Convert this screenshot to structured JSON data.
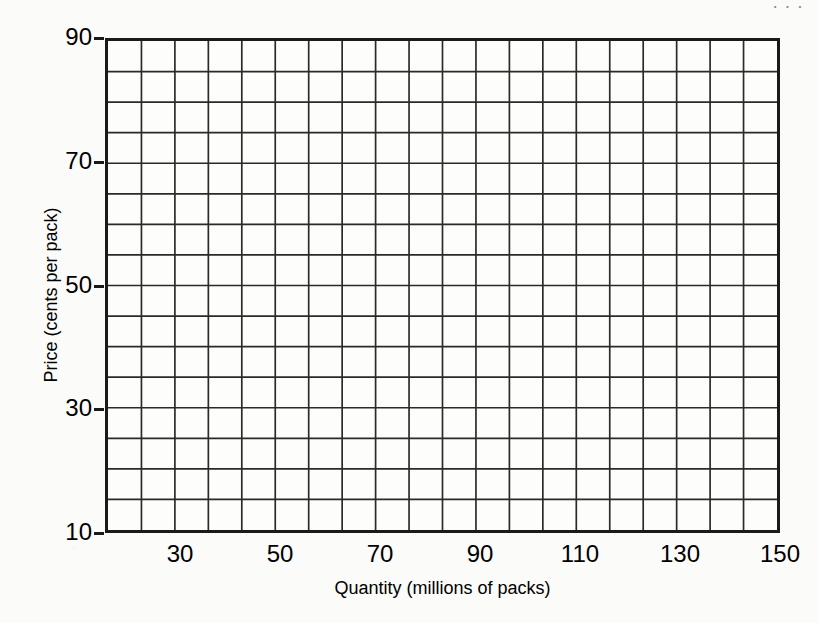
{
  "header_fragment": "···",
  "chart_data": {
    "type": "scatter",
    "title": "",
    "subtitle": "",
    "xlabel": "Quantity (millions of packs)",
    "ylabel": "Price (cents per pack)",
    "xlim": [
      15,
      150
    ],
    "ylim": [
      10,
      90
    ],
    "x_tick_labels": [
      "30",
      "50",
      "70",
      "90",
      "110",
      "130",
      "150"
    ],
    "x_tick_values": [
      30,
      50,
      70,
      90,
      110,
      130,
      150
    ],
    "y_tick_labels": [
      "90",
      "70",
      "50",
      "30",
      "10"
    ],
    "y_tick_values": [
      90,
      70,
      50,
      30,
      10
    ],
    "grid": true,
    "grid_columns": 20,
    "grid_rows": 16,
    "legend": [],
    "series": [],
    "annotations": [],
    "note": "Blank graph-paper grid: empty plotting area with no data plotted"
  },
  "axes": {
    "y_title": "Price (cents per pack)",
    "x_title": "Quantity (millions of packs)"
  },
  "colors": {
    "ink": "#1a1a1a",
    "paper": "#fbfbf9",
    "grid": "#2a2a2a"
  }
}
